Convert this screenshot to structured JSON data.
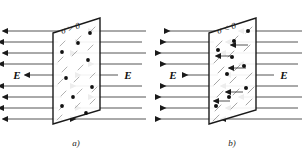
{
  "figure": {
    "background_color": "#ffffff",
    "line_color": "#1a1a1a",
    "hatch_color": "#9a9a9a",
    "charge_color": "#111111"
  },
  "panels": [
    {
      "id": "panel-a",
      "caption": "a)",
      "surface_charge_label": "σ > 0",
      "field_label_left": "E",
      "field_label_right": "E",
      "field_direction_left": "left",
      "field_direction_right": "right",
      "charge_sign": "positive",
      "plane": {
        "top_left_x": 53,
        "top_left_y": 33,
        "top_right_x": 100,
        "top_right_y": 18,
        "bottom_right_x": 100,
        "bottom_right_y": 110,
        "bottom_left_x": 53,
        "bottom_left_y": 124
      },
      "field_line_count": 9,
      "charge_dot_count": 9,
      "hatch_count": 16
    },
    {
      "id": "panel-b",
      "caption": "b)",
      "surface_charge_label": "σ < 0",
      "field_label_left": "E",
      "field_label_right": "E",
      "field_direction_left": "right",
      "field_direction_right": "left",
      "charge_sign": "negative",
      "plane": {
        "top_left_x": 209,
        "top_left_y": 33,
        "top_right_x": 256,
        "top_right_y": 18,
        "bottom_right_x": 256,
        "bottom_right_y": 110,
        "bottom_left_x": 209,
        "bottom_left_y": 124
      },
      "field_line_count": 9,
      "charge_dot_count": 9,
      "hatch_count": 16
    }
  ]
}
